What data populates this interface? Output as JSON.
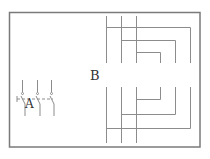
{
  "diagram": {
    "type": "circuit-schematic",
    "labels": {
      "a": "A",
      "b": "B"
    },
    "colors": {
      "frame": "#7a7a7a",
      "wire": "#8c8c8c",
      "background": "#ffffff",
      "text": "#333333"
    },
    "components": [
      {
        "id": "A",
        "kind": "three-pole-switch",
        "poles": 3
      },
      {
        "id": "B",
        "kind": "nested-bracket-wiring",
        "conductors": 3
      }
    ]
  }
}
